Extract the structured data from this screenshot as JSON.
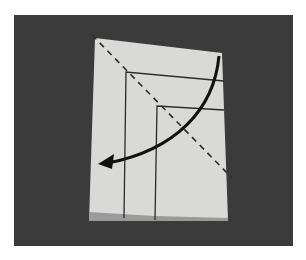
{
  "figure": {
    "background_color": "#3b3b3b",
    "paper_color": "#d8d8d6",
    "line_color": "#2a2a2a",
    "arrow": {
      "direction": "curved, top-right to lower-left",
      "color": "#111111"
    },
    "fold_line": {
      "style": "dashed",
      "from": "top-left corner",
      "to": "lower-right"
    }
  }
}
